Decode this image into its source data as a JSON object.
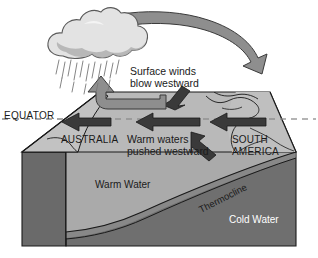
{
  "diagram": {
    "type": "cross-section-block-diagram"
  },
  "labels": {
    "equator": "EQUATOR",
    "surface_winds_line1": "Surface winds",
    "surface_winds_line2": "blow westward",
    "australia": "AUSTRALIA",
    "warm_waters_line1": "Warm waters",
    "warm_waters_line2": "pushed westward",
    "south_america_line1": "SOUTH",
    "south_america_line2": "AMERICA",
    "warm_water": "Warm Water",
    "cold_water": "Cold Water",
    "thermocline": "Thermocline"
  },
  "icons": {
    "cloud": "rain-cloud-icon",
    "rain": "rainfall-icon",
    "walker_arrow": "curved-circulation-arrow-icon",
    "rising_air_arrow": "rising-air-arrow-icon",
    "current_arrow_west_1": "westward-current-arrow-icon",
    "current_arrow_west_2": "westward-current-arrow-icon",
    "current_arrow_west_3": "westward-current-arrow-icon",
    "descending_arrow": "descending-air-arrow-icon",
    "upwelling_arrow": "upwelling-arrow-icon",
    "coastline": "coastline-outline-icon",
    "equator_dashes": "equator-dashed-line-icon"
  },
  "colors": {
    "background": "#ffffff",
    "top_surface": "#b9b9b9",
    "left_flank": "#bdbdbd",
    "warm_water": "#aaaaaa",
    "cold_water": "#6f6f6f",
    "side_face": "#6a6a6a",
    "arrow_dark": "#3a3a3a",
    "arrow_gray": "#8e8e8e",
    "cloud_light": "#e3e3e3",
    "cloud_shade": "#b0b0b0",
    "outline": "#1a1a1a",
    "equator_dash": "#8a8a8a",
    "text_dark": "#1a1a1a",
    "text_light": "#ffffff"
  }
}
